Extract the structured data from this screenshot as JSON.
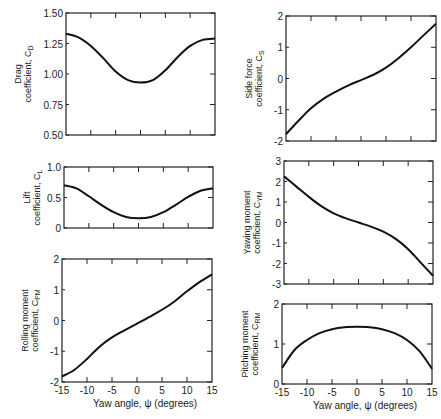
{
  "chart_data": [
    {
      "id": "drag",
      "type": "line",
      "ylabel_line1": "Drag",
      "ylabel_line2": "coefficient, C",
      "ylabel_sub": "D",
      "xlabel": "",
      "ylim": [
        0.5,
        1.5
      ],
      "yticks": [
        "0.50",
        "0.75",
        "1.00",
        "1.25",
        "1.50"
      ],
      "yticks_values": [
        0.5,
        0.75,
        1.0,
        1.25,
        1.5
      ],
      "xlim": [
        -15,
        15
      ],
      "x": [
        -15,
        -12.5,
        -10,
        -7.5,
        -5,
        -2.5,
        0,
        2.5,
        5,
        7.5,
        10,
        12.5,
        15
      ],
      "values": [
        1.33,
        1.3,
        1.23,
        1.13,
        1.02,
        0.95,
        0.93,
        0.95,
        1.03,
        1.14,
        1.23,
        1.28,
        1.29
      ],
      "frame": {
        "x0": 66,
        "x1": 215,
        "y0": 13,
        "y1": 135
      }
    },
    {
      "id": "lift",
      "type": "line",
      "ylabel_line1": "Lift",
      "ylabel_line2": "coefficient, C",
      "ylabel_sub": "L",
      "xlabel": "",
      "ylim": [
        0,
        1.0
      ],
      "yticks": [
        "0",
        "0.5",
        "1.0"
      ],
      "yticks_values": [
        0,
        0.5,
        1.0
      ],
      "xlim": [
        -15,
        15
      ],
      "x": [
        -15,
        -12.5,
        -10,
        -7.5,
        -5,
        -2.5,
        0,
        2.5,
        5,
        7.5,
        10,
        12.5,
        15
      ],
      "values": [
        0.7,
        0.65,
        0.52,
        0.38,
        0.26,
        0.18,
        0.16,
        0.18,
        0.26,
        0.38,
        0.51,
        0.61,
        0.65
      ],
      "frame": {
        "x0": 64,
        "x1": 213,
        "y0": 167,
        "y1": 228
      }
    },
    {
      "id": "rolling",
      "type": "line",
      "ylabel_line1": "Rolling moment",
      "ylabel_line2": "coefficient, C",
      "ylabel_sub": "PM",
      "xlabel": "Yaw angle, ψ    (degrees)",
      "ylim": [
        -2,
        2
      ],
      "yticks": [
        "-2",
        "-1",
        "0",
        "1",
        "2"
      ],
      "yticks_values": [
        -2,
        -1,
        0,
        1,
        2
      ],
      "xlim": [
        -15,
        15
      ],
      "xticks": [
        "-15",
        "-10",
        "-5",
        "0",
        "5",
        "10",
        "15"
      ],
      "xticks_values": [
        -15,
        -10,
        -5,
        0,
        5,
        10,
        15
      ],
      "x": [
        -15,
        -12.5,
        -10,
        -7.5,
        -5,
        -2.5,
        0,
        2.5,
        5,
        7.5,
        10,
        12.5,
        15
      ],
      "values": [
        -1.82,
        -1.6,
        -1.25,
        -0.85,
        -0.55,
        -0.32,
        -0.1,
        0.12,
        0.35,
        0.62,
        0.95,
        1.25,
        1.5
      ],
      "frame": {
        "x0": 62,
        "x1": 212,
        "y0": 259,
        "y1": 382
      }
    },
    {
      "id": "side",
      "type": "line",
      "ylabel_line1": "Side force",
      "ylabel_line2": "coefficient, C",
      "ylabel_sub": "S",
      "xlabel": "",
      "ylim": [
        -2,
        2
      ],
      "yticks": [
        "-2",
        "-1",
        "0",
        "1",
        "2"
      ],
      "yticks_values": [
        -2,
        -1,
        0,
        1,
        2
      ],
      "xlim": [
        -15,
        15
      ],
      "x": [
        -15,
        -12.5,
        -10,
        -7.5,
        -5,
        -2.5,
        0,
        2.5,
        5,
        7.5,
        10,
        12.5,
        15
      ],
      "values": [
        -1.78,
        -1.35,
        -0.95,
        -0.65,
        -0.42,
        -0.22,
        -0.05,
        0.12,
        0.35,
        0.65,
        1.0,
        1.38,
        1.75
      ],
      "frame": {
        "x0": 286,
        "x1": 436,
        "y0": 16,
        "y1": 141
      }
    },
    {
      "id": "yawing",
      "type": "line",
      "ylabel_line1": "Yawing moment",
      "ylabel_line2": "coefficient, C",
      "ylabel_sub": "YM",
      "xlabel": "",
      "ylim": [
        -3,
        3
      ],
      "yticks": [
        "-3",
        "-2",
        "-1",
        "0",
        "1",
        "2",
        "3"
      ],
      "yticks_values": [
        -3,
        -2,
        -1,
        0,
        1,
        2,
        3
      ],
      "xlim": [
        -15,
        15
      ],
      "x": [
        -15,
        -12.5,
        -10,
        -7.5,
        -5,
        -2.5,
        0,
        2.5,
        5,
        7.5,
        10,
        12.5,
        15
      ],
      "values": [
        2.25,
        1.75,
        1.25,
        0.8,
        0.45,
        0.2,
        0.0,
        -0.2,
        -0.45,
        -0.8,
        -1.3,
        -1.95,
        -2.6
      ],
      "frame": {
        "x0": 284,
        "x1": 433,
        "y0": 161,
        "y1": 284
      }
    },
    {
      "id": "pitching",
      "type": "line",
      "ylabel_line1": "Pitching moment",
      "ylabel_line2": "coefficient, C",
      "ylabel_sub": "RM",
      "xlabel": "Yaw angle, ψ    (degrees)",
      "ylim": [
        0,
        2
      ],
      "yticks": [
        "0",
        "1",
        "2"
      ],
      "yticks_values": [
        0,
        1,
        2
      ],
      "xlim": [
        -15,
        15
      ],
      "xticks": [
        "-15",
        "-10",
        "-5",
        "0",
        "5",
        "10",
        "15"
      ],
      "xticks_values": [
        -15,
        -10,
        -5,
        0,
        5,
        10,
        15
      ],
      "x": [
        -15,
        -12.5,
        -10,
        -7.5,
        -5,
        -2.5,
        0,
        2.5,
        5,
        7.5,
        10,
        12.5,
        15
      ],
      "values": [
        0.4,
        0.85,
        1.1,
        1.27,
        1.37,
        1.42,
        1.43,
        1.42,
        1.37,
        1.27,
        1.1,
        0.82,
        0.38
      ],
      "frame": {
        "x0": 282,
        "x1": 432,
        "y0": 304,
        "y1": 384
      }
    }
  ]
}
